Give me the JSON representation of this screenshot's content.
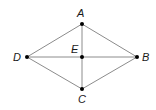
{
  "diagram": {
    "type": "rhombus-with-diagonals",
    "points": {
      "A": {
        "label": "A",
        "x": 82,
        "y": 24,
        "label_x": 80,
        "label_y": 17
      },
      "B": {
        "label": "B",
        "x": 137,
        "y": 57,
        "label_x": 142,
        "label_y": 61
      },
      "C": {
        "label": "C",
        "x": 82,
        "y": 89,
        "label_x": 77,
        "label_y": 103
      },
      "D": {
        "label": "D",
        "x": 27,
        "y": 57,
        "label_x": 13,
        "label_y": 61
      },
      "E": {
        "label": "E",
        "x": 82,
        "y": 57,
        "label_x": 71,
        "label_y": 53
      }
    },
    "segments": [
      [
        "A",
        "B"
      ],
      [
        "B",
        "C"
      ],
      [
        "C",
        "D"
      ],
      [
        "D",
        "A"
      ],
      [
        "A",
        "C"
      ],
      [
        "D",
        "B"
      ]
    ],
    "colors": {
      "edge": "#8c8c8c",
      "point": "#000000",
      "label": "#1a1a1a"
    }
  }
}
